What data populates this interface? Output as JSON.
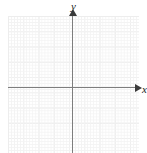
{
  "figure": {
    "type": "coordinate-plane",
    "title": "",
    "background_color": "#ffffff"
  },
  "grid": {
    "minor_line_color": "#f3f3f3",
    "major_line_color": "#e6e6e6",
    "minor_spacing_px": 3,
    "major_spacing_px": 15,
    "columns": 8,
    "rows": 9
  },
  "axes": {
    "color": "#7d7d7d",
    "arrow_color": "#3a3a3a",
    "x": {
      "label": "x",
      "icon": "arrow-right-icon",
      "tick_labels": []
    },
    "y": {
      "label": "y",
      "icon": "arrow-up-icon",
      "tick_labels": []
    },
    "origin": {
      "x": 73,
      "y": 88
    }
  },
  "chart_data": {
    "type": "scatter",
    "title": "",
    "xlabel": "x",
    "ylabel": "y",
    "xticklabels": [],
    "yticklabels": [],
    "series": [],
    "annotations": [],
    "grid": true,
    "legend": null
  }
}
